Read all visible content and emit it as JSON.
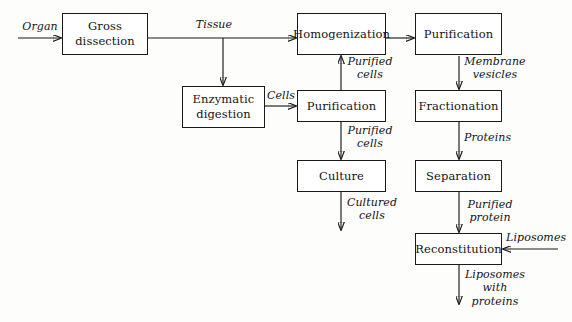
{
  "diagram": {
    "nodes": [
      {
        "id": "gross_dissection",
        "label": "Gross\ndissection"
      },
      {
        "id": "enzymatic_digestion",
        "label": "Enzymatic\ndigestion"
      },
      {
        "id": "homogenization",
        "label": "Homogenization"
      },
      {
        "id": "purification_cells",
        "label": "Purification"
      },
      {
        "id": "culture",
        "label": "Culture"
      },
      {
        "id": "purification_membrane",
        "label": "Purification"
      },
      {
        "id": "fractionation",
        "label": "Fractionation"
      },
      {
        "id": "separation",
        "label": "Separation"
      },
      {
        "id": "reconstitution",
        "label": "Reconstitution"
      }
    ],
    "edge_labels": [
      {
        "id": "organ",
        "text": "Organ"
      },
      {
        "id": "tissue",
        "text": "Tissue"
      },
      {
        "id": "cells",
        "text": "Cells"
      },
      {
        "id": "purified_cells_up",
        "text": "Purified\ncells"
      },
      {
        "id": "purified_cells_down",
        "text": "Purified\ncells"
      },
      {
        "id": "cultured_cells",
        "text": "Cultured\ncells"
      },
      {
        "id": "membrane_vesicles",
        "text": "Membrane\nvesicles"
      },
      {
        "id": "proteins",
        "text": "Proteins"
      },
      {
        "id": "purified_protein",
        "text": "Purified\nprotein"
      },
      {
        "id": "liposomes",
        "text": "Liposomes"
      },
      {
        "id": "liposomes_with_proteins",
        "text": "Liposomes\nwith\nproteins"
      }
    ],
    "colors": {
      "stroke": "#1a1a1a",
      "text": "#141414",
      "background": "#fdfdfb",
      "box_fill": "#ffffff"
    }
  }
}
